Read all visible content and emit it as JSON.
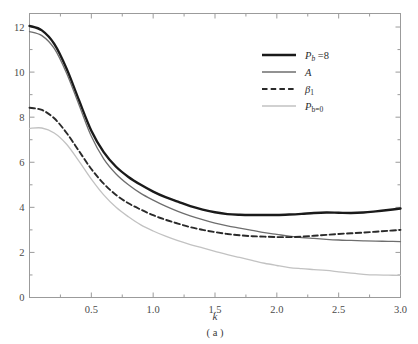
{
  "figure": {
    "caption": "( a )",
    "x_axis": {
      "label": "k",
      "ticks": [
        "0.5",
        "1.0",
        "1.5",
        "2.0",
        "2.5",
        "3.0"
      ],
      "tick_values": [
        0.5,
        1.0,
        1.5,
        2.0,
        2.5,
        3.0
      ],
      "range": [
        0,
        3.0
      ],
      "minor_step": 0.25
    },
    "y_axis": {
      "label": "",
      "ticks": [
        "0",
        "2",
        "4",
        "6",
        "8",
        "10",
        "12"
      ],
      "tick_values": [
        0,
        2,
        4,
        6,
        8,
        10,
        12
      ],
      "range": [
        0,
        12.6
      ],
      "minor_step": 1
    },
    "legend": {
      "position": "top-right",
      "items": [
        {
          "label_html": "P<sub>b</sub> =8",
          "name": "pb-8",
          "color": "#1a1a1a",
          "width": 2.4,
          "dash": "none"
        },
        {
          "label_html": "A",
          "name": "A",
          "color": "#6e6e6e",
          "width": 1.3,
          "dash": "none"
        },
        {
          "label_html": "β<sub>1</sub>",
          "name": "beta1",
          "color": "#2a2a2a",
          "width": 1.9,
          "dash": "5,3"
        },
        {
          "label_html": "P<sub>b=0</sub>",
          "name": "pb-0",
          "color": "#c2c2c2",
          "width": 1.3,
          "dash": "none"
        }
      ]
    }
  },
  "chart_data": {
    "type": "line",
    "title": "",
    "subtitle": "",
    "xlabel": "k",
    "ylabel": "",
    "caption": "( a )",
    "xlim": [
      0,
      3.0
    ],
    "ylim": [
      0,
      12.6
    ],
    "grid": false,
    "legend_position": "top-right",
    "x": [
      0.0,
      0.1,
      0.2,
      0.3,
      0.4,
      0.5,
      0.6,
      0.7,
      0.8,
      0.9,
      1.0,
      1.1,
      1.2,
      1.3,
      1.4,
      1.5,
      1.6,
      1.7,
      1.8,
      1.9,
      2.0,
      2.1,
      2.2,
      2.3,
      2.4,
      2.5,
      2.6,
      2.7,
      2.8,
      2.9,
      3.0
    ],
    "series": [
      {
        "name": "P_b =8",
        "color": "#1a1a1a",
        "style": "solid",
        "linewidth": 2.4,
        "values": [
          12.05,
          11.85,
          11.25,
          10.15,
          8.75,
          7.4,
          6.45,
          5.8,
          5.35,
          5.0,
          4.7,
          4.45,
          4.25,
          4.05,
          3.9,
          3.78,
          3.7,
          3.67,
          3.66,
          3.66,
          3.66,
          3.68,
          3.71,
          3.75,
          3.77,
          3.76,
          3.75,
          3.77,
          3.82,
          3.88,
          3.95
        ]
      },
      {
        "name": "A",
        "color": "#6e6e6e",
        "style": "solid",
        "linewidth": 1.3,
        "values": [
          11.8,
          11.62,
          11.05,
          9.95,
          8.55,
          7.15,
          6.15,
          5.48,
          5.0,
          4.62,
          4.32,
          4.05,
          3.82,
          3.62,
          3.45,
          3.3,
          3.18,
          3.08,
          2.98,
          2.88,
          2.8,
          2.72,
          2.66,
          2.62,
          2.58,
          2.55,
          2.53,
          2.51,
          2.5,
          2.49,
          2.48
        ]
      },
      {
        "name": "β1",
        "color": "#2a2a2a",
        "style": "dashed",
        "linewidth": 1.9,
        "values": [
          8.42,
          8.32,
          7.95,
          7.3,
          6.5,
          5.7,
          5.05,
          4.55,
          4.18,
          3.9,
          3.65,
          3.45,
          3.28,
          3.12,
          3.0,
          2.9,
          2.82,
          2.76,
          2.72,
          2.7,
          2.68,
          2.68,
          2.7,
          2.74,
          2.78,
          2.82,
          2.85,
          2.88,
          2.92,
          2.96,
          3.0
        ]
      },
      {
        "name": "P_b=0",
        "color": "#c2c2c2",
        "style": "solid",
        "linewidth": 1.3,
        "values": [
          7.5,
          7.52,
          7.3,
          6.8,
          6.05,
          5.25,
          4.55,
          4.0,
          3.58,
          3.22,
          2.95,
          2.72,
          2.52,
          2.35,
          2.2,
          2.05,
          1.9,
          1.78,
          1.65,
          1.52,
          1.42,
          1.33,
          1.28,
          1.24,
          1.2,
          1.14,
          1.08,
          1.03,
          1.0,
          0.99,
          0.98
        ]
      }
    ]
  }
}
